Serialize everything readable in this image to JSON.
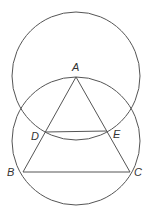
{
  "diagram": {
    "colors": {
      "stroke": "#555555",
      "label": "#333333",
      "background": "#ffffff"
    },
    "circles": [
      {
        "name": "upper-circle",
        "cx": 76,
        "cy": 76,
        "r": 64
      },
      {
        "name": "lower-circle",
        "cx": 76,
        "cy": 141,
        "r": 64
      }
    ],
    "points": {
      "A": {
        "x": 76,
        "y": 77
      },
      "B": {
        "x": 23,
        "y": 172
      },
      "C": {
        "x": 130,
        "y": 172
      },
      "D": {
        "x": 45,
        "y": 132
      },
      "E": {
        "x": 107,
        "y": 131
      }
    },
    "segments": [
      [
        "A",
        "B"
      ],
      [
        "A",
        "C"
      ],
      [
        "B",
        "C"
      ],
      [
        "D",
        "E"
      ]
    ],
    "labels": {
      "A": {
        "text": "A",
        "x": 72,
        "y": 71
      },
      "B": {
        "text": "B",
        "x": 7,
        "y": 176
      },
      "C": {
        "text": "C",
        "x": 134,
        "y": 176
      },
      "D": {
        "text": "D",
        "x": 31,
        "y": 140
      },
      "E": {
        "text": "E",
        "x": 113,
        "y": 138
      }
    }
  }
}
